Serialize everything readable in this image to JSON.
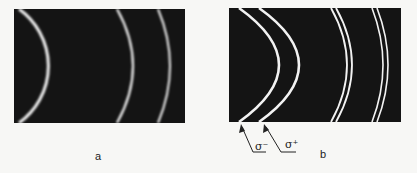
{
  "figure": {
    "panels": [
      {
        "id": "a",
        "label": "a",
        "ring_count": 3,
        "split": false
      },
      {
        "id": "b",
        "label": "b",
        "ring_count": 3,
        "split": true
      }
    ],
    "annotations": {
      "sigma_minus": "σ⁻",
      "sigma_plus": "σ⁺"
    },
    "colors": {
      "background": "#141414",
      "ring": "#f0f0f0"
    }
  }
}
